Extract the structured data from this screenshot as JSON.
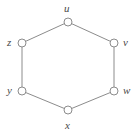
{
  "figure": {
    "name": "hexagon-cycle-graph",
    "background_color": "#ffffff",
    "width": 139,
    "height": 138
  },
  "style": {
    "edge_color": "#8c8c8c",
    "edge_width": 1,
    "vertex_stroke_color": "#8c8c8c",
    "vertex_fill_color": "#ffffff",
    "vertex_radius": 4,
    "vertex_stroke_width": 1,
    "label_color": "#4a4a4a",
    "label_font_size": 11
  },
  "graph": {
    "type": "cycle",
    "vertex_count": 6,
    "edge_count": 6,
    "vertices": [
      {
        "id": "u",
        "label": "u",
        "cx": 68,
        "cy": 22,
        "label_x": 64,
        "label_y": 3,
        "label_position": "above"
      },
      {
        "id": "v",
        "label": "v",
        "cx": 114,
        "cy": 43,
        "label_x": 123,
        "label_y": 37,
        "label_position": "right"
      },
      {
        "id": "w",
        "label": "w",
        "cx": 114,
        "cy": 91,
        "label_x": 123,
        "label_y": 85,
        "label_position": "right"
      },
      {
        "id": "x",
        "label": "x",
        "cx": 68,
        "cy": 110,
        "label_x": 65,
        "label_y": 120,
        "label_position": "below"
      },
      {
        "id": "y",
        "label": "y",
        "cx": 22,
        "cy": 91,
        "label_x": 7,
        "label_y": 85,
        "label_position": "left"
      },
      {
        "id": "z",
        "label": "z",
        "cx": 22,
        "cy": 43,
        "label_x": 7,
        "label_y": 37,
        "label_position": "left"
      }
    ],
    "edges": [
      {
        "from": "z",
        "to": "u",
        "x1": 22,
        "y1": 43,
        "x2": 68,
        "y2": 22
      },
      {
        "from": "u",
        "to": "v",
        "x1": 68,
        "y1": 22,
        "x2": 114,
        "y2": 43
      },
      {
        "from": "v",
        "to": "w",
        "x1": 114,
        "y1": 43,
        "x2": 114,
        "y2": 91
      },
      {
        "from": "w",
        "to": "x",
        "x1": 114,
        "y1": 91,
        "x2": 68,
        "y2": 110
      },
      {
        "from": "x",
        "to": "y",
        "x1": 68,
        "y1": 110,
        "x2": 22,
        "y2": 91
      },
      {
        "from": "y",
        "to": "z",
        "x1": 22,
        "y1": 91,
        "x2": 22,
        "y2": 43
      }
    ]
  }
}
